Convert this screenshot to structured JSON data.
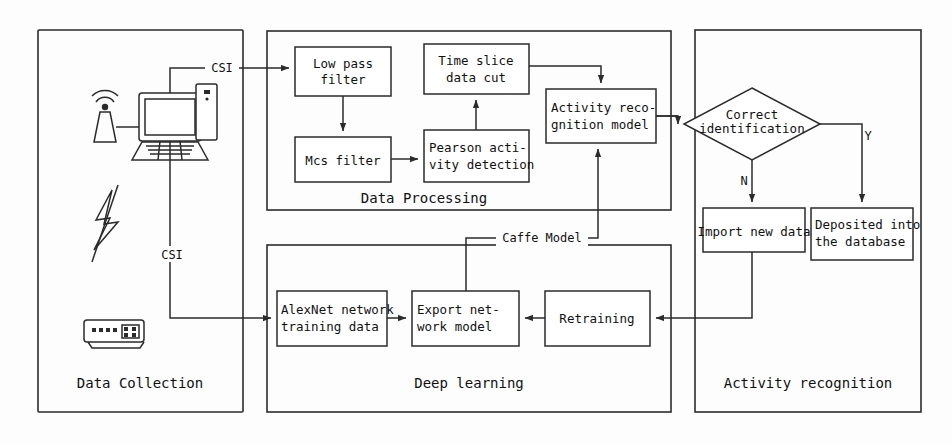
{
  "figure": {
    "type": "flowchart"
  },
  "panels": [
    {
      "id": "data-collection",
      "label": "Data Collection"
    },
    {
      "id": "data-processing",
      "label": "Data Processing"
    },
    {
      "id": "deep-learning",
      "label": "Deep learning"
    },
    {
      "id": "activity-recognition",
      "label": "Activity recognition"
    }
  ],
  "boxes": [
    {
      "id": "low-pass-filter",
      "lines": [
        "Low pass",
        "filter"
      ]
    },
    {
      "id": "time-slice-data-cut",
      "lines": [
        "Time slice",
        "data cut"
      ]
    },
    {
      "id": "mcs-filter",
      "lines": [
        "Mcs filter"
      ]
    },
    {
      "id": "pearson-activity-detection",
      "lines": [
        "Pearson acti-",
        "vity detection"
      ]
    },
    {
      "id": "activity-recognition-model",
      "lines": [
        "Activity reco-",
        "gnition model"
      ]
    },
    {
      "id": "import-new-data",
      "lines": [
        "Import new data"
      ]
    },
    {
      "id": "deposited-into-the-database",
      "lines": [
        "Deposited into",
        "the database"
      ]
    },
    {
      "id": "alexnet-network-training-data",
      "lines": [
        "AlexNet network",
        "training data"
      ]
    },
    {
      "id": "export-network-model",
      "lines": [
        "Export net-",
        "work model"
      ]
    },
    {
      "id": "retraining",
      "lines": [
        "Retraining"
      ]
    }
  ],
  "decision": {
    "id": "correct-identification",
    "lines": [
      "Correct",
      "identification"
    ],
    "branch_yes": "Y",
    "branch_no": "N"
  },
  "edge_labels": {
    "csi_top": "CSI",
    "csi_bottom": "CSI",
    "caffe_model": "Caffe Model"
  },
  "icons": [
    {
      "id": "antenna-icon",
      "name": "wifi-antenna-icon"
    },
    {
      "id": "computer-icon",
      "name": "desktop-computer-icon"
    },
    {
      "id": "lightning-icon",
      "name": "lightning-signal-icon"
    },
    {
      "id": "router-icon",
      "name": "router-device-icon"
    }
  ],
  "colors": {
    "stroke": "#2b2b2b",
    "text": "#111111",
    "background": "#fdfdfd",
    "box_fill": "#ffffff"
  }
}
